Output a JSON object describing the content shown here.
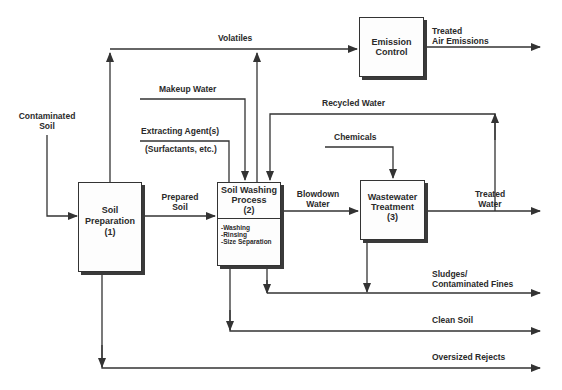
{
  "diagram": {
    "type": "process-flow",
    "boxes": {
      "soil_preparation": {
        "title": "Soil\nPreparation\n(1)",
        "line1": "Soil",
        "line2": "Preparation",
        "line3": "(1)"
      },
      "soil_washing": {
        "line1": "Soil Washing",
        "line2": "Process",
        "line3": "(2)",
        "steps": [
          "-Washing",
          "-Rinsing",
          "-Size Separation"
        ]
      },
      "emission_control": {
        "line1": "Emission",
        "line2": "Control"
      },
      "wastewater_treatment": {
        "line1": "Wastewater",
        "line2": "Treatment",
        "line3": "(3)"
      }
    },
    "flows": {
      "contaminated_soil": {
        "line1": "Contaminated",
        "line2": "Soil"
      },
      "volatiles": "Volatiles",
      "treated_air": {
        "line1": "Treated",
        "line2": "Air Emissions"
      },
      "makeup_water": "Makeup Water",
      "extracting_agent": "Extracting Agent(s)",
      "surfactants": "(Surfactants, etc.)",
      "recycled_water": "Recycled Water",
      "chemicals": "Chemicals",
      "prepared_soil": {
        "line1": "Prepared",
        "line2": "Soil"
      },
      "blowdown_water": {
        "line1": "Blowdown",
        "line2": "Water"
      },
      "treated_water": {
        "line1": "Treated",
        "line2": "Water"
      },
      "sludges": {
        "line1": "Sludges/",
        "line2": "Contaminated Fines"
      },
      "clean_soil": "Clean Soil",
      "oversized_rejects": "Oversized Rejects"
    },
    "colors": {
      "line": "#333333",
      "text": "#2a2a2a",
      "background": "#ffffff"
    }
  }
}
